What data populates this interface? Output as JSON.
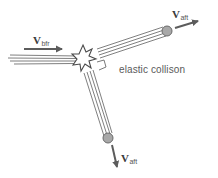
{
  "diagram": {
    "title": "elastic collison",
    "colors": {
      "arrow": "#5c5c5c",
      "streak": "#6e6e6e",
      "ball_fill": "#a8a8a8",
      "ball_stroke": "#6a6a6a",
      "text": "#555555"
    },
    "incoming": {
      "vector_symbol": "V",
      "vector_subscript": "bfr",
      "direction": "right"
    },
    "outgoing_upper": {
      "vector_symbol": "V",
      "vector_subscript": "aft",
      "direction": "up-right"
    },
    "outgoing_lower": {
      "vector_symbol": "V",
      "vector_subscript": "aft",
      "direction": "down"
    },
    "collision_marker": "starburst",
    "angle_marker": "right-angle (90°) between outgoing paths",
    "caption": "elastic collison"
  }
}
